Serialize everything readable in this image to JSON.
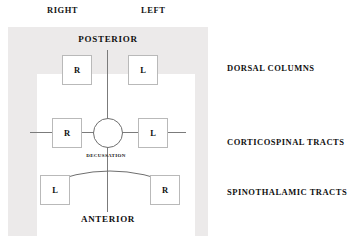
{
  "figure": {
    "orientation": {
      "right": "RIGHT",
      "left": "LEFT",
      "posterior": "POSTERIOR",
      "anterior": "ANTERIOR"
    },
    "central_structure": {
      "name": "central-canal",
      "shape": "circle"
    },
    "decussation_label": "DECUSSATION",
    "tract_boxes": [
      {
        "id": "dorsal-column-right",
        "label": "R",
        "side": "right",
        "group": "dorsal-columns",
        "position": "posterior-right"
      },
      {
        "id": "dorsal-column-left",
        "label": "L",
        "side": "left",
        "group": "dorsal-columns",
        "position": "posterior-left"
      },
      {
        "id": "corticospinal-right",
        "label": "R",
        "side": "right",
        "group": "corticospinal-tracts",
        "position": "lateral-right"
      },
      {
        "id": "corticospinal-left",
        "label": "L",
        "side": "left",
        "group": "corticospinal-tracts",
        "position": "lateral-left"
      },
      {
        "id": "spinothalamic-left",
        "label": "L",
        "side": "left",
        "group": "spinothalamic-tracts",
        "position": "anterior-right"
      },
      {
        "id": "spinothalamic-right",
        "label": "R",
        "side": "right",
        "group": "spinothalamic-tracts",
        "position": "anterior-left"
      }
    ],
    "legend": [
      {
        "id": "dorsal-columns",
        "label": "DORSAL COLUMNS"
      },
      {
        "id": "corticospinal-tracts",
        "label": "CORTICOSPINAL TRACTS"
      },
      {
        "id": "spinothalamic-tracts",
        "label": "SPINOTHALAMIC TRACTS"
      }
    ],
    "colors": {
      "panel_background": "#eceaea",
      "field_background": "#ffffff",
      "line": "#6f6f6f",
      "box_border": "#b9b9b9",
      "text": "#111111",
      "page_background": "#ffffff"
    }
  }
}
